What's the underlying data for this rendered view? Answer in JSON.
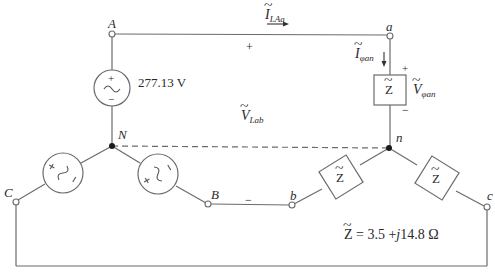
{
  "diagram": {
    "nodes": {
      "A": "A",
      "a": "a",
      "N": "N",
      "n": "n",
      "B": "B",
      "b": "b",
      "C": "C",
      "c": "c"
    },
    "source": {
      "voltage_label": "277.13 V",
      "plus": "+",
      "minus": "−"
    },
    "current_line": {
      "symbol": "I",
      "subscript": "LAa"
    },
    "current_phase": {
      "symbol": "I",
      "subscript": "φan"
    },
    "voltage_phase": {
      "symbol": "V",
      "subscript": "φan",
      "plus": "+",
      "minus": "−"
    },
    "voltage_line": {
      "symbol": "V",
      "subscript": "Lab",
      "plus": "+",
      "minus": "−"
    },
    "impedance": {
      "box_label": "Z",
      "equation": "= 3.5 +",
      "j": "j",
      "equation_tail": "14.8 Ω"
    },
    "colors": {
      "wire": "#6b6b6b",
      "text": "#2a2a2a",
      "background": "#ffffff"
    }
  }
}
